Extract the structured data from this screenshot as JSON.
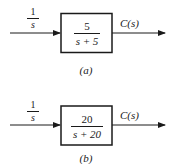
{
  "diagrams": [
    {
      "id": "a",
      "caption": "(a)",
      "input_label": {
        "numerator": "1",
        "denominator": "s"
      },
      "block": {
        "numerator": "5",
        "denominator": "s + 5"
      },
      "output_label": "C(s)"
    },
    {
      "id": "b",
      "caption": "(b)",
      "input_label": {
        "numerator": "1",
        "denominator": "s"
      },
      "block": {
        "numerator": "20",
        "denominator": "s + 20"
      },
      "output_label": "C(s)"
    }
  ],
  "colors": {
    "stroke": "#1a1a1a",
    "background": "#ffffff"
  }
}
